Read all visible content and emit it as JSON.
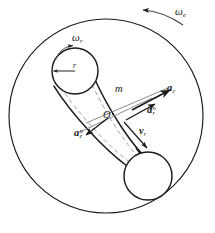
{
  "figure": {
    "type": "mechanics-kinematics-diagram",
    "background_color": "#ffffff",
    "stroke_color": "#1a1a1a",
    "dashed_color": "#9a9a9a",
    "width": 215,
    "height": 233
  },
  "labels": {
    "omega_e": {
      "base": "ω",
      "sub": "e",
      "x": 175,
      "y": 6,
      "size": 11
    },
    "omega_r": {
      "base": "ω",
      "sub": "r",
      "x": 72,
      "y": 32,
      "size": 11
    },
    "radius_r": {
      "base": "r",
      "x": 73,
      "y": 62,
      "size": 7
    },
    "mass_m": {
      "base": "m",
      "x": 115,
      "y": 84,
      "size": 10
    },
    "origin_O": {
      "base": "O",
      "x": 103,
      "y": 110,
      "size": 10
    },
    "a_c": {
      "base": "a",
      "sub": "c",
      "x": 167,
      "y": 83,
      "size": 10
    },
    "a_r_n": {
      "base": "a",
      "sup": "n",
      "sub": "r",
      "x": 147,
      "y": 105,
      "size": 10
    },
    "a_e_n": {
      "base": "a",
      "sup": "n",
      "sub": "e",
      "x": 74,
      "y": 128,
      "size": 10
    },
    "v_r": {
      "base": "v",
      "sub": "r",
      "x": 139,
      "y": 126,
      "size": 10
    }
  },
  "geometry": {
    "big_circle": {
      "cx": 106,
      "cy": 116,
      "r": 97
    },
    "top_pulley": {
      "cx": 75,
      "cy": 71,
      "r": 23
    },
    "bottom_pulley": {
      "cx": 148,
      "cy": 176,
      "r": 24
    }
  },
  "arcs": {
    "omega_e_arc_direction": "counterclockwise",
    "omega_r_arc_direction": "clockwise",
    "belt_motion_direction": "toward-bottom-right"
  },
  "vectors": [
    {
      "name": "a_c",
      "direction": "up-right",
      "style": "solid-bold-arrow"
    },
    {
      "name": "a_r_n",
      "direction": "up-right",
      "style": "solid-arrow"
    },
    {
      "name": "a_e_n",
      "direction": "down-left",
      "style": "solid-arrow"
    },
    {
      "name": "v_r",
      "direction": "down-right",
      "style": "solid-arrow"
    },
    {
      "name": "radius_r",
      "direction": "left-to-center",
      "style": "double-arrow"
    }
  ]
}
